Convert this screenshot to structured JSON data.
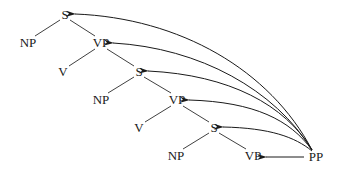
{
  "diagram": {
    "type": "syntax-tree",
    "nodes": [
      {
        "id": "S1",
        "label": "S",
        "x": 65,
        "y": 15
      },
      {
        "id": "NP1",
        "label": "NP",
        "x": 28,
        "y": 43
      },
      {
        "id": "VP1",
        "label": "VP",
        "x": 101,
        "y": 43
      },
      {
        "id": "V1",
        "label": "V",
        "x": 63,
        "y": 72
      },
      {
        "id": "S2",
        "label": "S",
        "x": 139,
        "y": 72
      },
      {
        "id": "NP2",
        "label": "NP",
        "x": 101,
        "y": 100
      },
      {
        "id": "VP2",
        "label": "VP",
        "x": 177,
        "y": 100
      },
      {
        "id": "V2",
        "label": "V",
        "x": 139,
        "y": 128
      },
      {
        "id": "S3",
        "label": "S",
        "x": 214,
        "y": 128
      },
      {
        "id": "NP3",
        "label": "NP",
        "x": 176,
        "y": 156
      },
      {
        "id": "VP3",
        "label": "VP",
        "x": 253,
        "y": 156
      },
      {
        "id": "PP",
        "label": "PP",
        "x": 316,
        "y": 157
      }
    ],
    "tree_edges": [
      [
        "S1",
        "NP1"
      ],
      [
        "S1",
        "VP1"
      ],
      [
        "VP1",
        "V1"
      ],
      [
        "VP1",
        "S2"
      ],
      [
        "S2",
        "NP2"
      ],
      [
        "S2",
        "VP2"
      ],
      [
        "VP2",
        "V2"
      ],
      [
        "VP2",
        "S3"
      ],
      [
        "S3",
        "NP3"
      ],
      [
        "S3",
        "VP3"
      ]
    ],
    "attachment_arrows": [
      {
        "from": "PP",
        "to": "S1"
      },
      {
        "from": "PP",
        "to": "VP1"
      },
      {
        "from": "PP",
        "to": "S2"
      },
      {
        "from": "PP",
        "to": "VP2"
      },
      {
        "from": "PP",
        "to": "S3"
      },
      {
        "from": "PP",
        "to": "VP3"
      }
    ]
  }
}
